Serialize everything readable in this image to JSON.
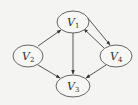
{
  "diagram": {
    "type": "directed-graph",
    "nodes": [
      {
        "id": "V1",
        "letter": "V",
        "sub": "1",
        "cx": 73,
        "cy": 22,
        "rx": 16,
        "ry": 11
      },
      {
        "id": "V2",
        "letter": "V",
        "sub": "2",
        "cx": 28,
        "cy": 56,
        "rx": 15,
        "ry": 11
      },
      {
        "id": "V3",
        "letter": "V",
        "sub": "3",
        "cx": 73,
        "cy": 86,
        "rx": 17,
        "ry": 11
      },
      {
        "id": "V4",
        "letter": "V",
        "sub": "4",
        "cx": 116,
        "cy": 56,
        "rx": 16,
        "ry": 11
      }
    ],
    "edges": [
      {
        "from": "V2",
        "to": "V1"
      },
      {
        "from": "V2",
        "to": "V3"
      },
      {
        "from": "V1",
        "to": "V3"
      },
      {
        "from": "V1",
        "to": "V4"
      },
      {
        "from": "V4",
        "to": "V1"
      },
      {
        "from": "V4",
        "to": "V3"
      }
    ],
    "colors": {
      "background": "#f4f4f2",
      "stroke": "#444444"
    }
  }
}
